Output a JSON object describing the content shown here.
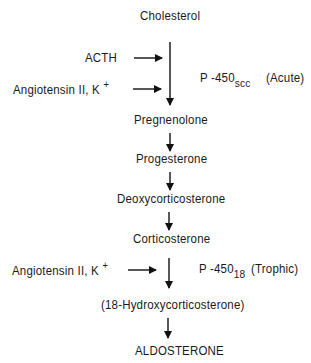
{
  "diagram": {
    "pathway": [
      "Cholesterol",
      "Pregnenolone",
      "Progesterone",
      "Deoxycorticosterone",
      "Corticosterone",
      "(18-Hydroxycorticosterone)",
      "ALDOSTERONE"
    ],
    "regulators_step1": {
      "acth": "ACTH",
      "angiotensin": "Angiotensin II, K",
      "angiotensin_sup": "+",
      "enzyme": "P -450",
      "enzyme_sub": "scc",
      "phase": "(Acute)"
    },
    "regulators_step2": {
      "angiotensin": "Angiotensin II, K",
      "angiotensin_sup": "+",
      "enzyme": "P -450",
      "enzyme_sub": "18",
      "phase": "(Trophic)"
    }
  }
}
